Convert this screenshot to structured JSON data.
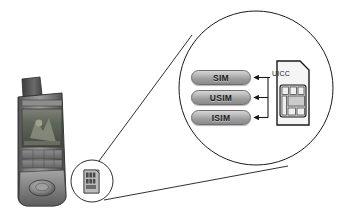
{
  "figure": {
    "background_color": "#ffffff",
    "line_color": "#1a1a1a"
  },
  "device": {
    "name": "mobile-phone",
    "type": "clamshell flip phone",
    "body_color": "#6f6f6f",
    "screen_color": "#5a5f55",
    "antenna_color": "#4a4a4a"
  },
  "small_callout": {
    "name": "sim-card-thumbnail",
    "shape": "circle",
    "card_color": "#9a9a9a"
  },
  "magnifier": {
    "name": "magnified-view",
    "shape": "circle",
    "stroke": "#1a1a1a"
  },
  "applications": [
    {
      "id": "sim",
      "label": "SIM"
    },
    {
      "id": "usim",
      "label": "USIM"
    },
    {
      "id": "isim",
      "label": "ISIM"
    }
  ],
  "card": {
    "label": "UICC",
    "name": "uicc-card",
    "body_color": "#f2f2f2",
    "chip_color": "#cfcfcf",
    "outline_color": "#1a1a1a"
  },
  "arrows": {
    "count": 3,
    "direction": "right-to-left",
    "color": "#1a1a1a"
  }
}
